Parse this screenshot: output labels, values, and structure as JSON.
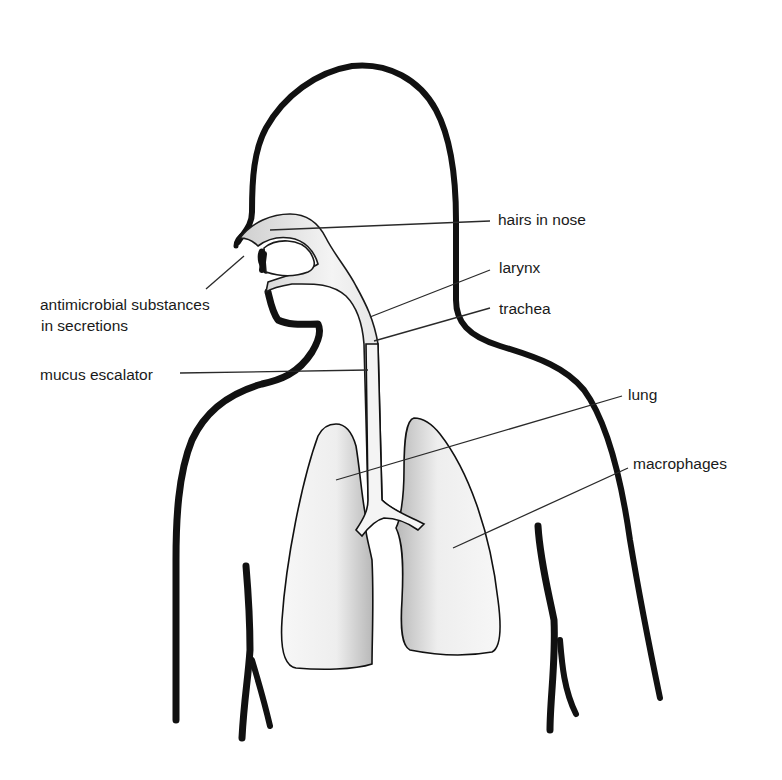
{
  "figure": {
    "labels": {
      "hairs_in_nose": "hairs in nose",
      "larynx": "larynx",
      "trachea": "trachea",
      "antimicrobial_line1": "antimicrobial substances",
      "antimicrobial_line2": "in secretions",
      "mucus_escalator": "mucus escalator",
      "lung": "lung",
      "macrophages": "macrophages"
    },
    "colors": {
      "outline": "#111111",
      "lung_fill": "#f2f2f2",
      "lung_shade": "#bdbdbd",
      "background": "#ffffff"
    }
  }
}
